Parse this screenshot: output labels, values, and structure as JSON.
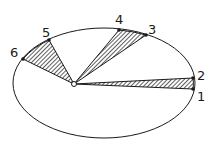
{
  "diagram": {
    "ellipse": {
      "cx": 104,
      "cy": 83,
      "rx": 91,
      "ry": 55,
      "stroke": "#1a1a1a"
    },
    "focus": {
      "x": 74,
      "y": 84
    },
    "points": [
      {
        "id": "p1",
        "label": "1",
        "x": 193,
        "y": 89,
        "lx": 197,
        "ly": 101
      },
      {
        "id": "p2",
        "label": "2",
        "x": 193,
        "y": 78,
        "lx": 197,
        "ly": 80
      },
      {
        "id": "p3",
        "label": "3",
        "x": 146,
        "y": 35,
        "lx": 148,
        "ly": 34
      },
      {
        "id": "p4",
        "label": "4",
        "x": 119,
        "y": 30,
        "lx": 115,
        "ly": 24
      },
      {
        "id": "p5",
        "label": "5",
        "x": 49,
        "y": 40,
        "lx": 42,
        "ly": 37
      },
      {
        "id": "p6",
        "label": "6",
        "x": 23,
        "y": 59,
        "lx": 10,
        "ly": 57
      }
    ],
    "sectors": [
      {
        "name": "sector-1-2",
        "from": "1",
        "to": "2"
      },
      {
        "name": "sector-3-4",
        "from": "3",
        "to": "4"
      },
      {
        "name": "sector-5-6",
        "from": "5",
        "to": "6"
      }
    ],
    "hatch_color": "#1a1a1a"
  }
}
